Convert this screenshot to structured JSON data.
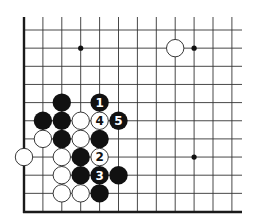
{
  "diagram": {
    "type": "go-board-fragment",
    "colors": {
      "background": "#ffffff",
      "line": "#333333",
      "border": "#1a1a1a",
      "black_stone": "#111111",
      "white_stone": "#ffffff",
      "white_stone_outline": "#222222"
    },
    "grid": {
      "columns": 12,
      "rows": 10,
      "left_edge_is_border": true,
      "bottom_edge_is_border": true
    },
    "star_points": [
      {
        "col": 3,
        "row": 1
      },
      {
        "col": 9,
        "row": 1
      },
      {
        "col": 9,
        "row": 7
      }
    ],
    "stones": [
      {
        "color": "white",
        "col": 8,
        "row": 1,
        "label": ""
      },
      {
        "color": "black",
        "col": 2,
        "row": 4,
        "label": ""
      },
      {
        "color": "black",
        "col": 4,
        "row": 4,
        "label": "1"
      },
      {
        "color": "black",
        "col": 1,
        "row": 5,
        "label": ""
      },
      {
        "color": "black",
        "col": 2,
        "row": 5,
        "label": ""
      },
      {
        "color": "white",
        "col": 3,
        "row": 5,
        "label": ""
      },
      {
        "color": "white",
        "col": 4,
        "row": 5,
        "label": "4"
      },
      {
        "color": "black",
        "col": 5,
        "row": 5,
        "label": "5"
      },
      {
        "color": "white",
        "col": 1,
        "row": 6,
        "label": ""
      },
      {
        "color": "black",
        "col": 2,
        "row": 6,
        "label": ""
      },
      {
        "color": "white",
        "col": 3,
        "row": 6,
        "label": ""
      },
      {
        "color": "black",
        "col": 4,
        "row": 6,
        "label": ""
      },
      {
        "color": "white",
        "col": 0,
        "row": 7,
        "label": ""
      },
      {
        "color": "white",
        "col": 2,
        "row": 7,
        "label": ""
      },
      {
        "color": "black",
        "col": 3,
        "row": 7,
        "label": ""
      },
      {
        "color": "white",
        "col": 4,
        "row": 7,
        "label": "2"
      },
      {
        "color": "white",
        "col": 2,
        "row": 8,
        "label": ""
      },
      {
        "color": "black",
        "col": 3,
        "row": 8,
        "label": ""
      },
      {
        "color": "black",
        "col": 4,
        "row": 8,
        "label": "3"
      },
      {
        "color": "black",
        "col": 5,
        "row": 8,
        "label": ""
      },
      {
        "color": "white",
        "col": 2,
        "row": 9,
        "label": ""
      },
      {
        "color": "white",
        "col": 3,
        "row": 9,
        "label": ""
      },
      {
        "color": "black",
        "col": 4,
        "row": 9,
        "label": ""
      }
    ],
    "move_labels": [
      "1",
      "2",
      "3",
      "4",
      "5"
    ]
  }
}
